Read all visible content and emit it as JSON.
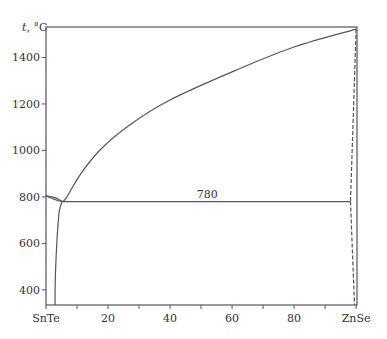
{
  "chart_data": {
    "type": "line",
    "title": "",
    "xlabel": "",
    "ylabel": "t, °C",
    "ylabel_italic_part": "t",
    "ylabel_rest": ", °C",
    "xlim": [
      0,
      100.3
    ],
    "ylim": [
      335,
      1531
    ],
    "grid": false,
    "x_ticks": [
      {
        "value": 0,
        "label": "SnTe"
      },
      {
        "value": 10,
        "label": ""
      },
      {
        "value": 20,
        "label": "20"
      },
      {
        "value": 30,
        "label": ""
      },
      {
        "value": 40,
        "label": "40"
      },
      {
        "value": 50,
        "label": ""
      },
      {
        "value": 60,
        "label": "60"
      },
      {
        "value": 70,
        "label": ""
      },
      {
        "value": 80,
        "label": "80"
      },
      {
        "value": 90,
        "label": ""
      },
      {
        "value": 100,
        "label": "ZnSe"
      }
    ],
    "y_ticks": [
      {
        "value": 400,
        "label": "400"
      },
      {
        "value": 600,
        "label": "600"
      },
      {
        "value": 800,
        "label": "800"
      },
      {
        "value": 1000,
        "label": "1000"
      },
      {
        "value": 1200,
        "label": "1200"
      },
      {
        "value": 1400,
        "label": "1400"
      }
    ],
    "series": [
      {
        "name": "liquidus-ZnSe",
        "style": "solid",
        "points": [
          [
            5.2,
            780
          ],
          [
            6.5,
            796
          ],
          [
            11,
            895
          ],
          [
            17.4,
            1002
          ],
          [
            27,
            1110
          ],
          [
            40,
            1217
          ],
          [
            60,
            1338
          ],
          [
            80,
            1445
          ],
          [
            100,
            1522
          ]
        ]
      },
      {
        "name": "liquidus-SnTe",
        "style": "solid",
        "points": [
          [
            0,
            806
          ],
          [
            2,
            800
          ],
          [
            4,
            790
          ],
          [
            5.2,
            780
          ]
        ]
      },
      {
        "name": "solidus-SnTe",
        "style": "solid",
        "points": [
          [
            0,
            806
          ],
          [
            1.5,
            796
          ],
          [
            3.5,
            786
          ],
          [
            5.2,
            780
          ]
        ]
      },
      {
        "name": "eutectic-line",
        "style": "solid",
        "points": [
          [
            5.2,
            780
          ],
          [
            98.2,
            780
          ]
        ]
      },
      {
        "name": "solvus-SnTe",
        "style": "solid",
        "points": [
          [
            5.2,
            780
          ],
          [
            4.3,
            740
          ],
          [
            3.7,
            650
          ],
          [
            3.3,
            550
          ],
          [
            3.0,
            450
          ],
          [
            2.9,
            335
          ]
        ]
      },
      {
        "name": "solvus-ZnSe-upper",
        "style": "dashed",
        "points": [
          [
            100,
            1522
          ],
          [
            98.2,
            780
          ]
        ]
      },
      {
        "name": "solvus-ZnSe-lower",
        "style": "dashed",
        "points": [
          [
            98.2,
            780
          ],
          [
            99.5,
            335
          ]
        ]
      }
    ],
    "annotations": [
      {
        "text": "780",
        "x": 52,
        "y": 780,
        "position": "above-line"
      }
    ]
  }
}
